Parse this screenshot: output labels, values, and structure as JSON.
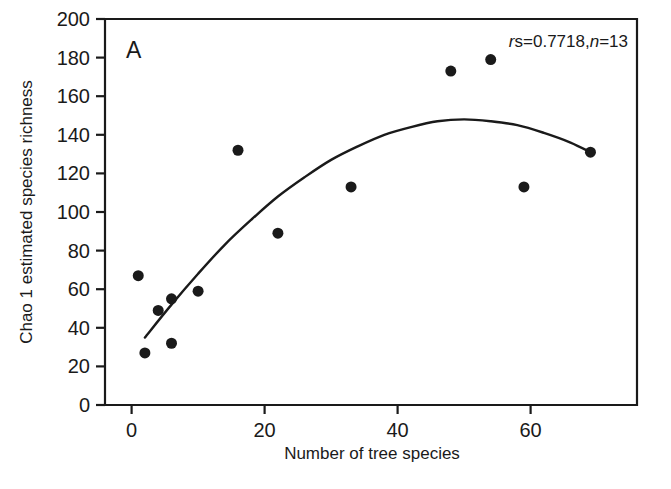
{
  "figure": {
    "panel_label": "A",
    "annotation": {
      "full_text": "rs=0.7718,n=13",
      "r_symbol": "r",
      "subscript_s": "s",
      "equals_value": "=0.7718,",
      "n_symbol": "n",
      "n_value": "=13"
    }
  },
  "chart_data": {
    "type": "scatter",
    "title": "",
    "xlabel": "Number of tree species",
    "ylabel": "Chao 1 estimated species richness",
    "xlim": [
      -4,
      76
    ],
    "ylim": [
      0,
      200
    ],
    "xticks": [
      0,
      20,
      40,
      60
    ],
    "yticks": [
      0,
      20,
      40,
      60,
      80,
      100,
      120,
      140,
      160,
      180,
      200
    ],
    "xtick_labels": [
      "0",
      "20",
      "40",
      "60"
    ],
    "ytick_labels": [
      "0",
      "20",
      "40",
      "60",
      "80",
      "100",
      "120",
      "140",
      "160",
      "180",
      "200"
    ],
    "grid": false,
    "legend": false,
    "n_points": 13,
    "spearman_rs": 0.7718,
    "marker_color": "#1a1a1a",
    "marker_size": 11,
    "points": [
      {
        "x": 1,
        "y": 67
      },
      {
        "x": 2,
        "y": 27
      },
      {
        "x": 4,
        "y": 49
      },
      {
        "x": 6,
        "y": 55
      },
      {
        "x": 6,
        "y": 32
      },
      {
        "x": 10,
        "y": 59
      },
      {
        "x": 16,
        "y": 132
      },
      {
        "x": 22,
        "y": 89
      },
      {
        "x": 33,
        "y": 113
      },
      {
        "x": 48,
        "y": 173
      },
      {
        "x": 54,
        "y": 179
      },
      {
        "x": 59,
        "y": 113
      },
      {
        "x": 69,
        "y": 131
      }
    ],
    "fit_curve": {
      "kind": "quadratic",
      "color": "#1a1a1a",
      "points": [
        {
          "x": 2,
          "y": 35
        },
        {
          "x": 6,
          "y": 52
        },
        {
          "x": 10,
          "y": 68
        },
        {
          "x": 14,
          "y": 83
        },
        {
          "x": 18,
          "y": 96
        },
        {
          "x": 22,
          "y": 108
        },
        {
          "x": 26,
          "y": 118
        },
        {
          "x": 30,
          "y": 127
        },
        {
          "x": 34,
          "y": 134
        },
        {
          "x": 38,
          "y": 140
        },
        {
          "x": 42,
          "y": 144
        },
        {
          "x": 46,
          "y": 147
        },
        {
          "x": 50,
          "y": 148
        },
        {
          "x": 54,
          "y": 147
        },
        {
          "x": 58,
          "y": 145
        },
        {
          "x": 62,
          "y": 141
        },
        {
          "x": 66,
          "y": 136
        },
        {
          "x": 69,
          "y": 131
        }
      ]
    }
  }
}
